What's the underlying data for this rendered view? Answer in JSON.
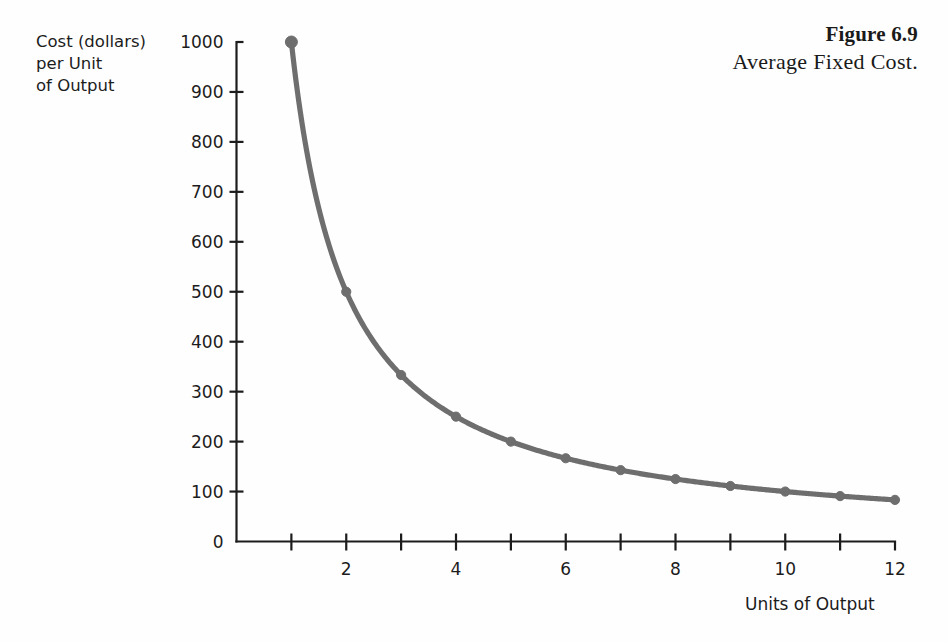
{
  "caption": {
    "figure_number": "Figure 6.9",
    "title": "Average Fixed Cost."
  },
  "y_axis_title": {
    "line1": "Cost (dollars)",
    "line2": "per Unit",
    "line3": "of Output"
  },
  "x_axis_title": "Units of Output",
  "colors": {
    "curve": "#6e6e6e",
    "axis": "#1c1c1c",
    "text": "#1c1c1c",
    "background": "#fefefe"
  },
  "chart_data": {
    "type": "line",
    "title": "Average Fixed Cost.",
    "subtitle": "Figure 6.9",
    "xlabel": "Units of Output",
    "ylabel": "Cost (dollars) per Unit of Output",
    "x": [
      1,
      2,
      3,
      4,
      5,
      6,
      7,
      8,
      9,
      10,
      11,
      12
    ],
    "values": [
      1000,
      500,
      333,
      250,
      200,
      167,
      143,
      125,
      111,
      100,
      91,
      83
    ],
    "series": [
      {
        "name": "Average Fixed Cost",
        "values": [
          1000,
          500,
          333,
          250,
          200,
          167,
          143,
          125,
          111,
          100,
          91,
          83
        ]
      }
    ],
    "xlim": [
      0,
      12
    ],
    "ylim": [
      0,
      1000
    ],
    "x_ticks": [
      1,
      2,
      3,
      4,
      5,
      6,
      7,
      8,
      9,
      10,
      11,
      12
    ],
    "x_tick_labels": [
      "",
      "2",
      "",
      "4",
      "",
      "6",
      "",
      "8",
      "",
      "10",
      "",
      "12"
    ],
    "y_ticks": [
      0,
      100,
      200,
      300,
      400,
      500,
      600,
      700,
      800,
      900,
      1000
    ],
    "y_tick_labels": [
      "0",
      "100",
      "200",
      "300",
      "400",
      "500",
      "600",
      "700",
      "800",
      "900",
      "1000"
    ],
    "grid": false,
    "legend": false,
    "markers": true,
    "marker_shape": "circle"
  }
}
